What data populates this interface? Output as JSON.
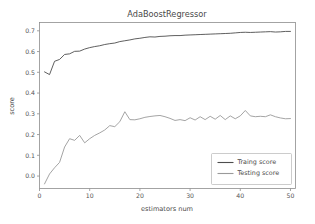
{
  "chart_data": {
    "type": "line",
    "title": "AdaBoostRegressor",
    "xlabel": "estimators num",
    "ylabel": "score",
    "xlim": [
      0,
      51
    ],
    "ylim": [
      -0.06,
      0.74
    ],
    "xticks": [
      0,
      10,
      20,
      30,
      40,
      50
    ],
    "xtick_labels": [
      "0",
      "10",
      "20",
      "30",
      "40",
      "50"
    ],
    "yticks": [
      0.0,
      0.1,
      0.2,
      0.3,
      0.4,
      0.5,
      0.6,
      0.7
    ],
    "ytick_labels": [
      "0.0",
      "0.1",
      "0.2",
      "0.3",
      "0.4",
      "0.5",
      "0.6",
      "0.7"
    ],
    "grid": false,
    "legend_position": "lower right",
    "x": [
      1,
      2,
      3,
      4,
      5,
      6,
      7,
      8,
      9,
      10,
      11,
      12,
      13,
      14,
      15,
      16,
      17,
      18,
      19,
      20,
      21,
      22,
      23,
      24,
      25,
      26,
      27,
      28,
      29,
      30,
      31,
      32,
      33,
      34,
      35,
      36,
      37,
      38,
      39,
      40,
      41,
      42,
      43,
      44,
      45,
      46,
      47,
      48,
      49,
      50
    ],
    "series": [
      {
        "name": "Traing score",
        "color": "#4d4d4d",
        "values": [
          0.502,
          0.489,
          0.553,
          0.562,
          0.586,
          0.589,
          0.601,
          0.602,
          0.612,
          0.619,
          0.624,
          0.628,
          0.634,
          0.638,
          0.641,
          0.648,
          0.652,
          0.656,
          0.661,
          0.664,
          0.668,
          0.671,
          0.67,
          0.673,
          0.674,
          0.676,
          0.677,
          0.677,
          0.679,
          0.68,
          0.681,
          0.682,
          0.683,
          0.684,
          0.685,
          0.686,
          0.687,
          0.688,
          0.69,
          0.692,
          0.693,
          0.692,
          0.693,
          0.694,
          0.695,
          0.696,
          0.694,
          0.695,
          0.697,
          0.697
        ]
      },
      {
        "name": "Testing score",
        "color": "#9a9a9a",
        "values": [
          -0.038,
          0.01,
          0.04,
          0.066,
          0.14,
          0.18,
          0.172,
          0.196,
          0.16,
          0.18,
          0.196,
          0.208,
          0.222,
          0.243,
          0.238,
          0.262,
          0.31,
          0.272,
          0.271,
          0.276,
          0.283,
          0.287,
          0.29,
          0.292,
          0.286,
          0.278,
          0.268,
          0.272,
          0.267,
          0.281,
          0.27,
          0.286,
          0.272,
          0.288,
          0.274,
          0.292,
          0.272,
          0.29,
          0.276,
          0.29,
          0.316,
          0.29,
          0.286,
          0.288,
          0.286,
          0.295,
          0.286,
          0.28,
          0.276,
          0.277
        ]
      }
    ]
  },
  "legend": {
    "entries": [
      {
        "label": "Traing score",
        "color": "#4d4d4d"
      },
      {
        "label": "Testing score",
        "color": "#9a9a9a"
      }
    ]
  }
}
